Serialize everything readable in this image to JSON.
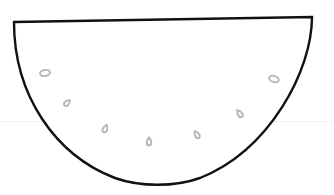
{
  "drawing": {
    "subject": "watermelon-slice",
    "outline_color": "#111111",
    "seed_color": "#b8b8b8",
    "guide_color": "#f2f2f2",
    "seeds": [
      {
        "cx": 45,
        "cy": 73,
        "rotate": -10
      },
      {
        "cx": 67,
        "cy": 103,
        "rotate": 40
      },
      {
        "cx": 105,
        "cy": 129,
        "rotate": 20
      },
      {
        "cx": 149,
        "cy": 142,
        "rotate": 0
      },
      {
        "cx": 197,
        "cy": 135,
        "rotate": -30
      },
      {
        "cx": 240,
        "cy": 114,
        "rotate": -35
      },
      {
        "cx": 274,
        "cy": 79,
        "rotate": 15
      }
    ]
  }
}
